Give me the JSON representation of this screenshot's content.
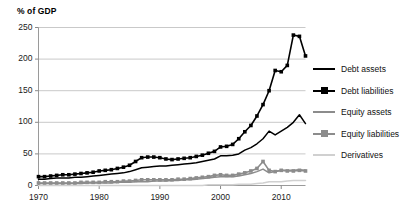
{
  "chart_data": {
    "type": "line",
    "title": "% of GDP",
    "xlabel": "",
    "ylabel": "% of GDP",
    "xlim": [
      1970,
      2014
    ],
    "ylim": [
      0,
      250
    ],
    "grid": true,
    "legend_position": "right",
    "y_ticks": [
      0,
      50,
      100,
      150,
      200,
      250
    ],
    "y_tick_labels": [
      "0",
      "50",
      "100",
      "150",
      "200",
      "250"
    ],
    "x_ticks": [
      1970,
      1980,
      1990,
      2000,
      2010
    ],
    "x_tick_labels": [
      "1970",
      "1980",
      "1990",
      "2000",
      "2010"
    ],
    "x": [
      1970,
      1971,
      1972,
      1973,
      1974,
      1975,
      1976,
      1977,
      1978,
      1979,
      1980,
      1981,
      1982,
      1983,
      1984,
      1985,
      1986,
      1987,
      1988,
      1989,
      1990,
      1991,
      1992,
      1993,
      1994,
      1995,
      1996,
      1997,
      1998,
      1999,
      2000,
      2001,
      2002,
      2003,
      2004,
      2005,
      2006,
      2007,
      2008,
      2009,
      2010,
      2011,
      2012,
      2013,
      2014
    ],
    "series": [
      {
        "name": "Debt assets",
        "color": "#000000",
        "marker": "none",
        "values": [
          10,
          10,
          11,
          12,
          12,
          12,
          13,
          13,
          14,
          15,
          16,
          17,
          18,
          19,
          20,
          22,
          25,
          28,
          29,
          30,
          31,
          31,
          32,
          33,
          34,
          35,
          36,
          38,
          40,
          42,
          47,
          47,
          48,
          50,
          56,
          60,
          66,
          74,
          86,
          80,
          86,
          92,
          100,
          112,
          98
        ]
      },
      {
        "name": "Debt liabilities",
        "color": "#000000",
        "marker": "square",
        "values": [
          14,
          14,
          15,
          16,
          17,
          17,
          18,
          19,
          20,
          21,
          23,
          24,
          25,
          27,
          29,
          32,
          38,
          44,
          45,
          45,
          44,
          42,
          41,
          42,
          43,
          44,
          46,
          48,
          51,
          54,
          61,
          62,
          65,
          74,
          85,
          95,
          110,
          128,
          150,
          182,
          180,
          190,
          238,
          236,
          205
        ]
      },
      {
        "name": "Equity assets",
        "color": "#8c8c8c",
        "marker": "none",
        "values": [
          3,
          3,
          3,
          3,
          3,
          3,
          3,
          3,
          4,
          4,
          4,
          4,
          4,
          5,
          5,
          5,
          6,
          6,
          6,
          7,
          7,
          7,
          8,
          8,
          9,
          9,
          10,
          11,
          12,
          13,
          14,
          14,
          14,
          15,
          17,
          19,
          22,
          26,
          20,
          22,
          24,
          24,
          24,
          25,
          24
        ]
      },
      {
        "name": "Equity liabilities",
        "color": "#8c8c8c",
        "marker": "square",
        "values": [
          4,
          4,
          4,
          4,
          4,
          4,
          4,
          5,
          5,
          5,
          5,
          6,
          6,
          6,
          7,
          7,
          8,
          9,
          9,
          9,
          9,
          9,
          9,
          10,
          10,
          11,
          12,
          13,
          14,
          16,
          17,
          16,
          16,
          18,
          20,
          23,
          27,
          38,
          24,
          22,
          24,
          23,
          23,
          24,
          23
        ]
      },
      {
        "name": "Derivatives",
        "color": "#d0d0d0",
        "marker": "none",
        "values": [
          0,
          0,
          0,
          0,
          0,
          0,
          0,
          0,
          0,
          0,
          0,
          0,
          0,
          0,
          0,
          0,
          0,
          0,
          0,
          0,
          0,
          0,
          0,
          0,
          0,
          0,
          0,
          0,
          1,
          1,
          1,
          1,
          1,
          2,
          2,
          2,
          3,
          4,
          6,
          6,
          6,
          7,
          8,
          8,
          8
        ]
      }
    ]
  },
  "legend": {
    "items": [
      {
        "label": "Debt assets"
      },
      {
        "label": "Debt liabilities"
      },
      {
        "label": "Equity assets"
      },
      {
        "label": "Equity liabilities"
      },
      {
        "label": "Derivatives"
      }
    ]
  }
}
